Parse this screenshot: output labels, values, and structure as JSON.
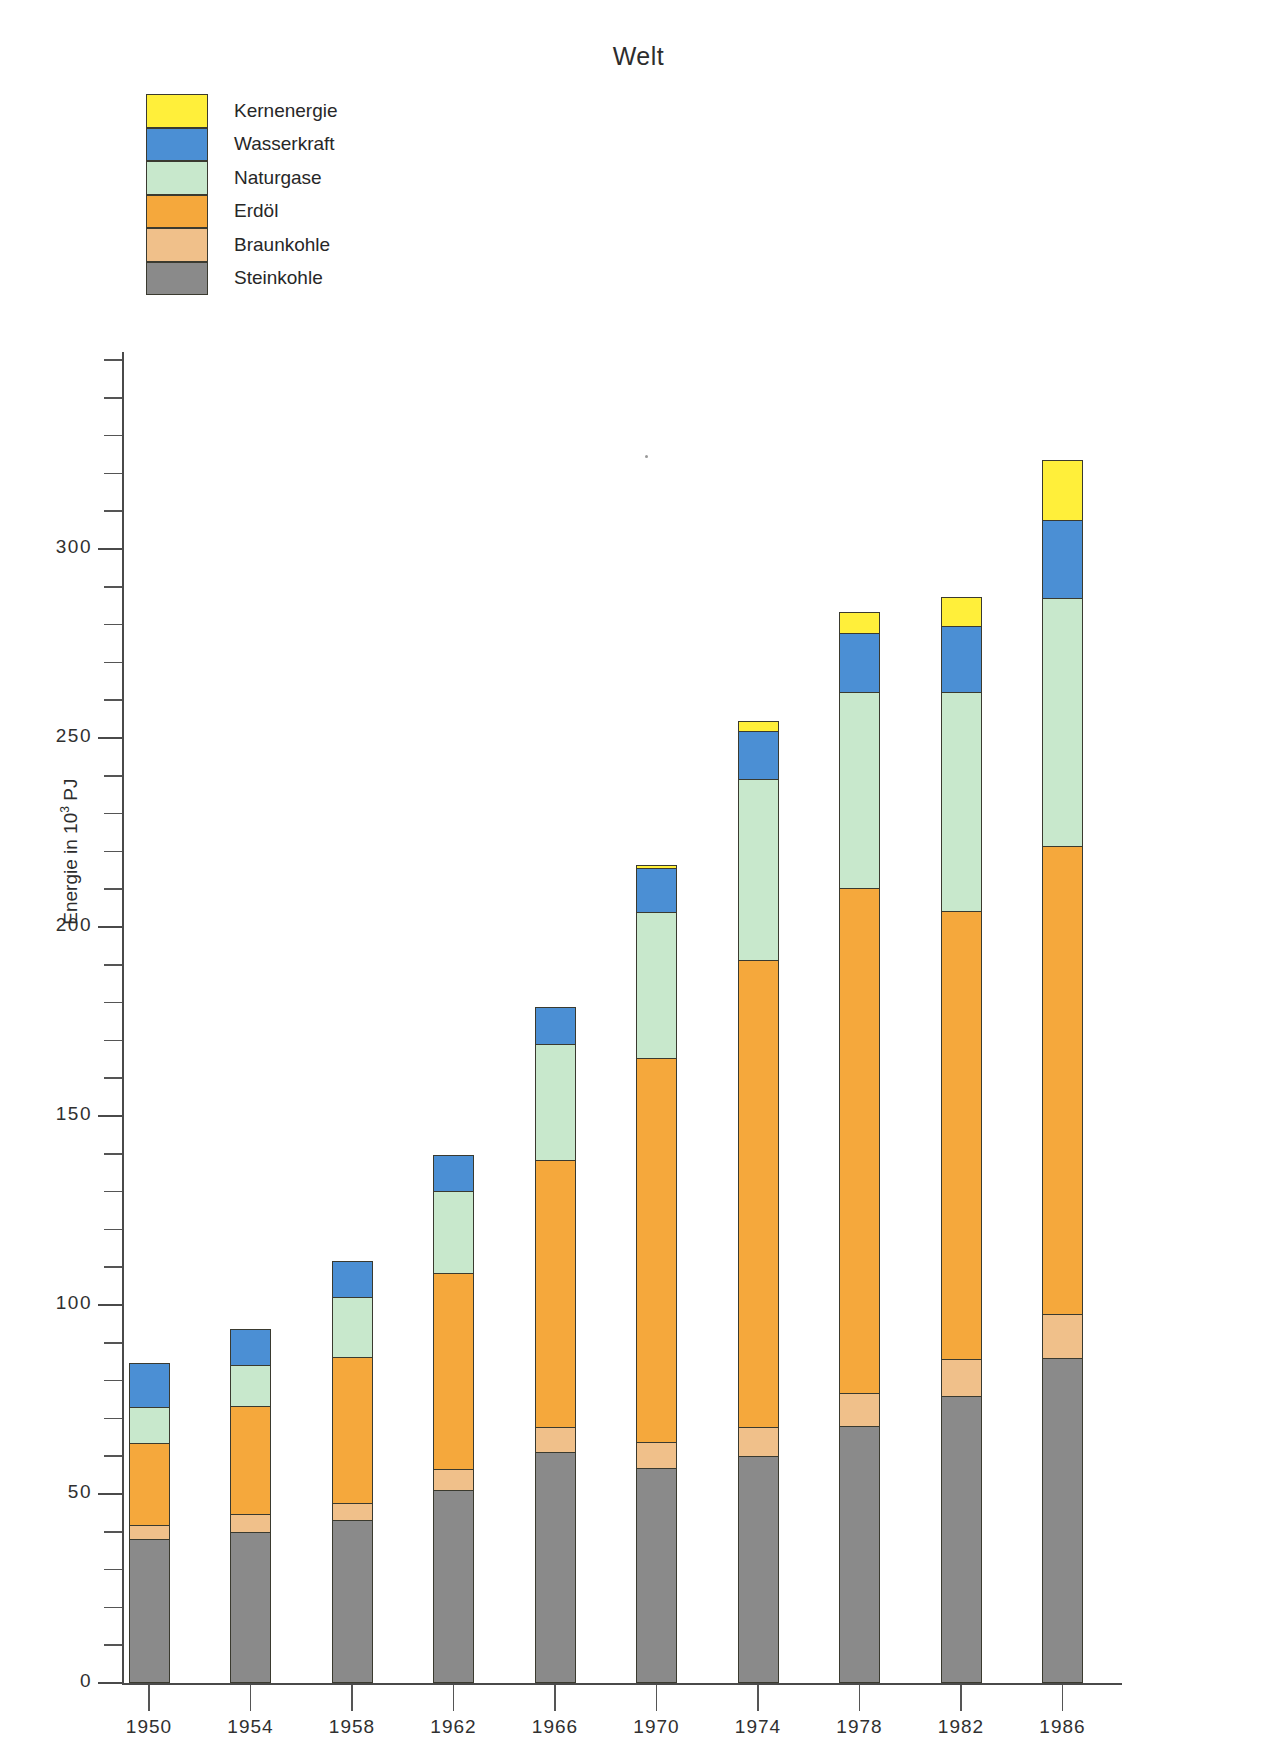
{
  "title": "Welt",
  "axis": {
    "y_label_text": "Energie in 10",
    "y_label_sup": "3",
    "y_label_unit": " PJ",
    "y_ticks": [
      {
        "value": 0,
        "label": "0"
      },
      {
        "value": 50,
        "label": "50"
      },
      {
        "value": 100,
        "label": "100"
      },
      {
        "value": 150,
        "label": "150"
      },
      {
        "value": 200,
        "label": "200"
      },
      {
        "value": 250,
        "label": "250"
      },
      {
        "value": 300,
        "label": "300"
      }
    ],
    "y_min": 0,
    "y_max": 350,
    "y_minor_step": 10
  },
  "legend": {
    "items": [
      {
        "label": "Kernenergie",
        "color": "#ffef3a"
      },
      {
        "label": "Wasserkraft",
        "color": "#4b8fd4"
      },
      {
        "label": "Naturgase",
        "color": "#c8e8cc"
      },
      {
        "label": "Erdöl",
        "color": "#f5a83c"
      },
      {
        "label": "Braunkohle",
        "color": "#f0c08a"
      },
      {
        "label": "Steinkohle",
        "color": "#8a8a8a"
      }
    ]
  },
  "chart_data": {
    "type": "bar",
    "subtype": "stacked",
    "title": "Welt",
    "xlabel": "",
    "ylabel": "Energie in 10³ PJ",
    "ylim": [
      0,
      350
    ],
    "grid": false,
    "legend_position": "top-left",
    "categories": [
      "1950",
      "1954",
      "1958",
      "1962",
      "1966",
      "1970",
      "1974",
      "1978",
      "1982",
      "1986"
    ],
    "series": [
      {
        "name": "Steinkohle",
        "color": "#8a8a8a",
        "values": [
          38,
          40,
          43,
          51,
          61,
          57,
          60,
          68,
          76,
          86
        ]
      },
      {
        "name": "Braunkohle",
        "color": "#f0c08a",
        "values": [
          42,
          45,
          48,
          57,
          68,
          64,
          68,
          77,
          86,
          98
        ]
      },
      {
        "name": "Erdöl",
        "color": "#f5a83c",
        "values": [
          64,
          74,
          87,
          109,
          139,
          166,
          192,
          211,
          205,
          222
        ]
      },
      {
        "name": "Naturgase",
        "color": "#c8e8cc",
        "values": [
          74,
          85,
          103,
          131,
          170,
          205,
          240,
          263,
          263,
          288
        ]
      },
      {
        "name": "Wasserkraft",
        "color": "#4b8fd4",
        "values": [
          86,
          95,
          113,
          141,
          180,
          217,
          253,
          279,
          281,
          309
        ]
      },
      {
        "name": "Kernenergie",
        "color": "#ffef3a",
        "values": [
          86,
          95,
          113,
          141,
          180,
          218,
          256,
          285,
          289,
          325
        ]
      }
    ],
    "series_note": "values are cumulative stack tops in 10^3 PJ",
    "stack_segments": [
      {
        "category": "1950",
        "Steinkohle": 38,
        "Braunkohle": 4,
        "Erdöl": 22,
        "Naturgase": 10,
        "Wasserkraft": 12,
        "Kernenergie": 0
      },
      {
        "category": "1954",
        "Steinkohle": 40,
        "Braunkohle": 5,
        "Erdöl": 29,
        "Naturgase": 11,
        "Wasserkraft": 10,
        "Kernenergie": 0
      },
      {
        "category": "1958",
        "Steinkohle": 43,
        "Braunkohle": 5,
        "Erdöl": 39,
        "Naturgase": 16,
        "Wasserkraft": 10,
        "Kernenergie": 0
      },
      {
        "category": "1962",
        "Steinkohle": 51,
        "Braunkohle": 6,
        "Erdöl": 52,
        "Naturgase": 22,
        "Wasserkraft": 10,
        "Kernenergie": 0
      },
      {
        "category": "1966",
        "Steinkohle": 61,
        "Braunkohle": 7,
        "Erdöl": 71,
        "Naturgase": 31,
        "Wasserkraft": 10,
        "Kernenergie": 0
      },
      {
        "category": "1970",
        "Steinkohle": 57,
        "Braunkohle": 7,
        "Erdöl": 102,
        "Naturgase": 39,
        "Wasserkraft": 12,
        "Kernenergie": 1
      },
      {
        "category": "1974",
        "Steinkohle": 60,
        "Braunkohle": 8,
        "Erdöl": 124,
        "Naturgase": 48,
        "Wasserkraft": 13,
        "Kernenergie": 3
      },
      {
        "category": "1978",
        "Steinkohle": 68,
        "Braunkohle": 9,
        "Erdöl": 134,
        "Naturgase": 52,
        "Wasserkraft": 16,
        "Kernenergie": 6
      },
      {
        "category": "1982",
        "Steinkohle": 76,
        "Braunkohle": 10,
        "Erdöl": 119,
        "Naturgase": 58,
        "Wasserkraft": 18,
        "Kernenergie": 8
      },
      {
        "category": "1986",
        "Steinkohle": 86,
        "Braunkohle": 12,
        "Erdöl": 124,
        "Naturgase": 66,
        "Wasserkraft": 21,
        "Kernenergie": 16
      }
    ]
  }
}
